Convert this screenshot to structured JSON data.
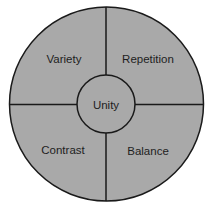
{
  "diagram": {
    "title": "",
    "center": {
      "label": "Unity"
    },
    "quadrants": [
      {
        "position": "top-left",
        "label": "Variety"
      },
      {
        "position": "top-right",
        "label": "Repetition"
      },
      {
        "position": "bottom-left",
        "label": "Contrast"
      },
      {
        "position": "bottom-right",
        "label": "Balance"
      }
    ],
    "colors": {
      "fill": "#a9a9a9",
      "stroke": "#1a1a1a",
      "background": "#ffffff"
    }
  }
}
